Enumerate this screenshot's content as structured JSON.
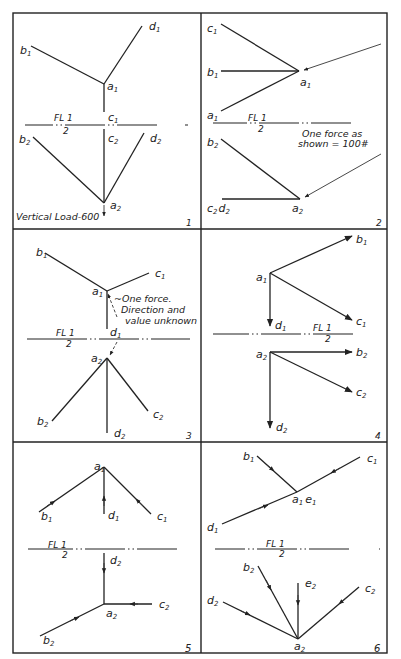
{
  "figure": {
    "panels": [
      {
        "number": "1",
        "fold_line": {
          "top": "FL 1",
          "bottom": "2"
        },
        "top_view_labels": [
          "b1",
          "d1",
          "a1",
          "c1"
        ],
        "front_view_labels": [
          "b2",
          "c2",
          "d2",
          "a2"
        ],
        "note": "Vertical Load-600"
      },
      {
        "number": "2",
        "fold_line": {
          "top": "FL 1",
          "bottom": "2"
        },
        "top_view_labels": [
          "c1",
          "b1",
          "a1",
          "a1"
        ],
        "front_view_labels": [
          "b2",
          "c2 d2",
          "a2"
        ],
        "note": "One force as shown = 100#"
      },
      {
        "number": "3",
        "fold_line": {
          "top": "FL 1",
          "bottom": "2"
        },
        "top_view_labels": [
          "b1",
          "c1",
          "a1",
          "d1"
        ],
        "front_view_labels": [
          "a2",
          "b2",
          "c2",
          "d2"
        ],
        "note": "One force. Direction and value unknown"
      },
      {
        "number": "4",
        "fold_line": {
          "top": "FL 1",
          "bottom": "2"
        },
        "top_view_labels": [
          "b1",
          "a1",
          "c1",
          "d1"
        ],
        "front_view_labels": [
          "a2",
          "b2",
          "c2",
          "d2"
        ],
        "note": ""
      },
      {
        "number": "5",
        "fold_line": {
          "top": "FL 1",
          "bottom": "2"
        },
        "top_view_labels": [
          "a1",
          "b1",
          "d1",
          "c1"
        ],
        "front_view_labels": [
          "d2",
          "a2",
          "c2",
          "b2"
        ],
        "note": ""
      },
      {
        "number": "6",
        "fold_line": {
          "top": "FL 1",
          "bottom": "2"
        },
        "top_view_labels": [
          "b1",
          "c1",
          "a1 e1",
          "d1"
        ],
        "front_view_labels": [
          "b2",
          "e2",
          "c2",
          "d2",
          "a2"
        ],
        "note": ""
      }
    ]
  },
  "p1": {
    "b1": "b",
    "b1s": "1",
    "d1": "d",
    "d1s": "1",
    "a1": "a",
    "a1s": "1",
    "c1": "c",
    "c1s": "1",
    "fl": "FL 1",
    "fl2": "2",
    "b2": "b",
    "b2s": "2",
    "c2": "c",
    "c2s": "2",
    "d2": "d",
    "d2s": "2",
    "a2": "a",
    "a2s": "2",
    "note": "Vertical Load-600",
    "num": "1"
  },
  "p2": {
    "c1": "c",
    "c1s": "1",
    "b1": "b",
    "b1s": "1",
    "a1": "a",
    "a1s": "1",
    "a1b": "a",
    "a1bs": "1",
    "fl": "FL 1",
    "fl2": "2",
    "note1": "One force as",
    "note2": "shown = 100#",
    "b2": "b",
    "b2s": "2",
    "c2d2": "c",
    "c2s": "2",
    "d2": "d",
    "d2s": "2",
    "a2": "a",
    "a2s": "2",
    "num": "2"
  },
  "p3": {
    "b1": "b",
    "b1s": "1",
    "c1": "c",
    "c1s": "1",
    "a1": "a",
    "a1s": "1",
    "d1": "d",
    "d1s": "1",
    "note1": "One force.",
    "note2": "Direction and",
    "note3": "value unknown",
    "fl": "FL 1",
    "fl2": "2",
    "a2": "a",
    "a2s": "2",
    "b2": "b",
    "b2s": "2",
    "c2": "c",
    "c2s": "2",
    "d2": "d",
    "d2s": "2",
    "num": "3"
  },
  "p4": {
    "b1": "b",
    "b1s": "1",
    "a1": "a",
    "a1s": "1",
    "c1": "c",
    "c1s": "1",
    "d1": "d",
    "d1s": "1",
    "fl": "FL 1",
    "fl2": "2",
    "a2": "a",
    "a2s": "2",
    "b2": "b",
    "b2s": "2",
    "c2": "c",
    "c2s": "2",
    "d2": "d",
    "d2s": "2",
    "num": "4"
  },
  "p5": {
    "a1": "a",
    "a1s": "1",
    "b1": "b",
    "b1s": "1",
    "d1": "d",
    "d1s": "1",
    "c1": "c",
    "c1s": "1",
    "fl": "FL 1",
    "fl2": "2",
    "d2": "d",
    "d2s": "2",
    "a2": "a",
    "a2s": "2",
    "c2": "c",
    "c2s": "2",
    "b2": "b",
    "b2s": "2",
    "num": "5"
  },
  "p6": {
    "b1": "b",
    "b1s": "1",
    "c1": "c",
    "c1s": "1",
    "a1": "a",
    "a1s": "1",
    "e1": "e",
    "e1s": "1",
    "d1": "d",
    "d1s": "1",
    "fl": "FL 1",
    "fl2": "2",
    "b2": "b",
    "b2s": "2",
    "e2": "e",
    "e2s": "2",
    "c2": "c",
    "c2s": "2",
    "d2": "d",
    "d2s": "2",
    "a2": "a",
    "a2s": "2",
    "num": "6"
  },
  "colors": {
    "ink": "#222222",
    "paper": "#ffffff"
  }
}
